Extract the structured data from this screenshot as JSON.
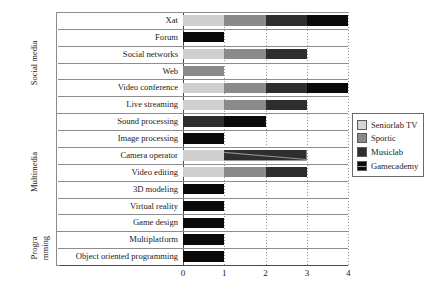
{
  "chart_data": {
    "type": "bar",
    "orientation": "horizontal",
    "stacked": true,
    "title": "",
    "xlabel": "",
    "ylabel": "",
    "xlim": [
      0,
      4
    ],
    "xticks": [
      "0",
      "1",
      "2",
      "3",
      "4"
    ],
    "grid": "vertical-dotted",
    "legend_position": "right",
    "categories": [
      "Xat",
      "Forum",
      "Social networks",
      "Web",
      "Video conference",
      "Live streaming",
      "Sound processing",
      "Image processing",
      "Camera operator",
      "Video editing",
      "3D modeling",
      "Virtual reality",
      "Game design",
      "Multiplatform",
      "Object oriented programming"
    ],
    "series": [
      {
        "name": "Seniorlab TV",
        "color": "#cfcfcf",
        "values": [
          1,
          0,
          1,
          0,
          1,
          1,
          0,
          0,
          1,
          1,
          0,
          0,
          0,
          0,
          0
        ]
      },
      {
        "name": "Sportic",
        "color": "#8a8a8a",
        "values": [
          1,
          0,
          1,
          1,
          1,
          1,
          0,
          0,
          0,
          1,
          0,
          0,
          0,
          0,
          0
        ]
      },
      {
        "name": "Musiclab",
        "color": "#2e2e2e",
        "values": [
          1,
          0,
          1,
          0,
          1,
          1,
          1,
          0,
          2,
          1,
          0,
          0,
          0,
          0,
          0
        ]
      },
      {
        "name": "Gamecademy",
        "color": "#0a0a0a",
        "values": [
          1,
          1,
          0,
          0,
          1,
          0,
          1,
          1,
          0,
          0,
          1,
          1,
          1,
          1,
          1
        ]
      }
    ],
    "totals": [
      4,
      1,
      3,
      1,
      4,
      3,
      2,
      1,
      3,
      3,
      1,
      1,
      1,
      1,
      1
    ],
    "groups": [
      {
        "label": "Social media",
        "categories": [
          "Xat",
          "Forum",
          "Social networks",
          "Web",
          "Video conference",
          "Live streaming"
        ]
      },
      {
        "label": "Multimedia",
        "categories": [
          "Sound processing",
          "Image processing",
          "Camera operator",
          "Video editing",
          "3D modeling",
          "Virtual reality",
          "Game design"
        ]
      },
      {
        "label": "Programming",
        "label_lines": [
          "Progra",
          "mming"
        ],
        "categories": [
          "Multiplatform",
          "Object oriented programming"
        ]
      }
    ]
  },
  "legend": {
    "items": [
      {
        "label": "Seniorlab TV"
      },
      {
        "label": "Sportic"
      },
      {
        "label": "Musiclab"
      },
      {
        "label": "Gamecademy"
      }
    ]
  }
}
